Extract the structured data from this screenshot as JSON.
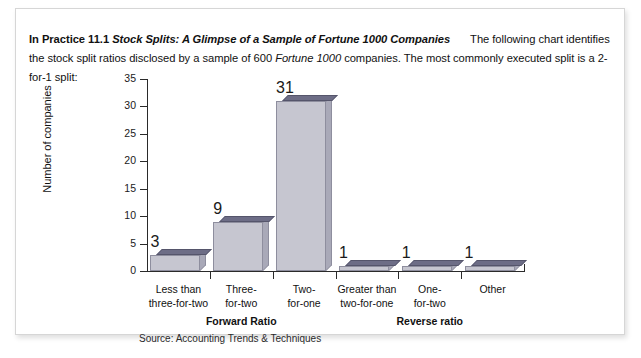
{
  "card": {
    "intro": {
      "label_bold": "In Practice 11.1",
      "title_bold_italic": "Stock Splits: A Glimpse of a Sample of Fortune 1000 Companies",
      "body_part1": "The following chart identifies the stock split ratios disclosed by a sample of 600 ",
      "body_italic": "Fortune 1000",
      "body_part2": " companies. The most commonly executed split is a 2-for-1 split:"
    },
    "source": "Source: Accounting Trends & Techniques"
  },
  "chart_data": {
    "type": "bar",
    "title": "",
    "xlabel": "",
    "ylabel": "Number of companies",
    "ylim": [
      0,
      35
    ],
    "yticks": [
      0,
      5,
      10,
      15,
      20,
      25,
      30,
      35
    ],
    "grid": false,
    "legend": null,
    "categories": [
      "Less than three-for-two",
      "Three-for-two",
      "Two-for-one",
      "Greater than two-for-one",
      "One-for-two",
      "Other"
    ],
    "category_lines": [
      [
        "Less than",
        "three-for-two"
      ],
      [
        "Three-",
        "for-two"
      ],
      [
        "Two-",
        "for-one"
      ],
      [
        "Greater than",
        "two-for-one"
      ],
      [
        "One-",
        "for-two"
      ],
      [
        "Other",
        ""
      ]
    ],
    "values": [
      3,
      9,
      31,
      1,
      1,
      1
    ],
    "groups": [
      {
        "label": "Forward Ratio",
        "categories": [
          0,
          1,
          2
        ]
      },
      {
        "label": "Reverse ratio",
        "categories": [
          3,
          4,
          5
        ]
      }
    ],
    "colors": {
      "bar_front": "#c6c6d0",
      "bar_top": "#6d6d86",
      "bar_side": "#a9a9b8",
      "bar_stroke": "#8e8e9e",
      "axis": "#2a2a2a"
    }
  }
}
